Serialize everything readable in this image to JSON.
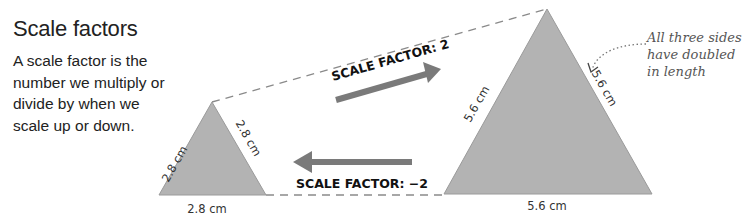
{
  "header": {
    "title": "Scale factors",
    "description": "A scale factor is the number we multiply or divide by when we scale up or down."
  },
  "small_triangle": {
    "left_side": "2.8 cm",
    "right_side": "2.8 cm",
    "base": "2.8 cm"
  },
  "large_triangle": {
    "left_side": "5.6 cm",
    "right_side": "5.6 cm",
    "base": "5.6 cm"
  },
  "arrows": {
    "enlarge_label": "SCALE FACTOR: 2",
    "reduce_label": "SCALE FACTOR: −2"
  },
  "annotation": {
    "note": "All three sides have doubled in length"
  },
  "colors": {
    "triangle_fill": "#b3b3b3",
    "arrow": "#7a7a7a",
    "dashed_line": "#888888"
  }
}
